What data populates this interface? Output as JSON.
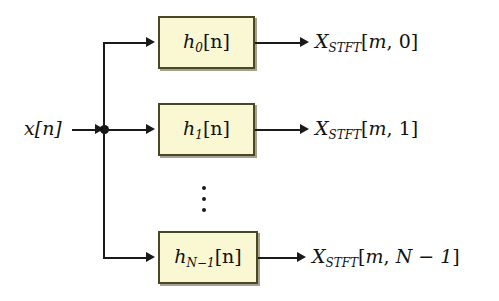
{
  "diagram": {
    "background_color": "#ffffff",
    "box_fill_color": "#f9f8d2",
    "box_border_color": "#4a4726",
    "wire_color": "#1a1a1a",
    "input": {
      "label_base": "x",
      "label_bracket": "[n]",
      "full_label": "x[n]"
    },
    "branches": [
      {
        "filter": {
          "base": "h",
          "subscript": "0",
          "bracket": "[n]",
          "full": "h0[n]"
        },
        "output": {
          "base": "X",
          "subscript": "STFT",
          "bracket_open": "[",
          "index_m": "m",
          "separator": ", ",
          "index_k": "0",
          "bracket_close": "]",
          "full": "XSTFT[m, 0]"
        }
      },
      {
        "filter": {
          "base": "h",
          "subscript": "1",
          "bracket": "[n]",
          "full": "h1[n]"
        },
        "output": {
          "base": "X",
          "subscript": "STFT",
          "bracket_open": "[",
          "index_m": "m",
          "separator": ", ",
          "index_k": "1",
          "bracket_close": "]",
          "full": "XSTFT[m, 1]"
        }
      },
      {
        "filter": {
          "base": "h",
          "subscript": "N−1",
          "bracket": "[n]",
          "full": "hN−1[n]"
        },
        "output": {
          "base": "X",
          "subscript": "STFT",
          "bracket_open": "[",
          "index_m": "m",
          "separator": ", ",
          "index_k": "N − 1",
          "bracket_close": "]",
          "full": "XSTFT[m, N − 1]"
        }
      }
    ],
    "ellipsis": {
      "orientation": "vertical",
      "symbol": "⋮",
      "meaning": "additional filter branches omitted"
    }
  }
}
